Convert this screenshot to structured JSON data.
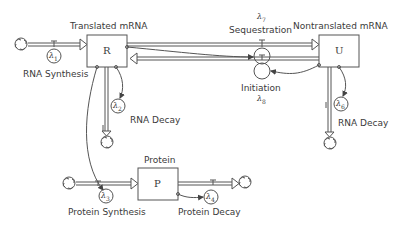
{
  "diagram": {
    "stocks": [
      {
        "id": "R",
        "symbol": "R",
        "title": "Translated mRNA"
      },
      {
        "id": "U",
        "symbol": "U",
        "title": "Nontranslated mRNA"
      },
      {
        "id": "P",
        "symbol": "P",
        "title": "Protein"
      }
    ],
    "flows": [
      {
        "id": "rna_synthesis",
        "label": "RNA Synthesis",
        "rate": "λ",
        "rate_sub": "1"
      },
      {
        "id": "rna_decay_r",
        "label": "RNA Decay",
        "rate": "λ",
        "rate_sub": "2"
      },
      {
        "id": "protein_synthesis",
        "label": "Protein Synthesis",
        "rate": "λ",
        "rate_sub": "3"
      },
      {
        "id": "protein_decay",
        "label": "Protein Decay",
        "rate": "λ",
        "rate_sub": "4"
      },
      {
        "id": "rna_decay_u",
        "label": "RNA Decay",
        "rate": "λ",
        "rate_sub": "6"
      },
      {
        "id": "sequestration",
        "label": "Sequestration",
        "rate": "λ",
        "rate_sub": "7"
      },
      {
        "id": "initiation",
        "label": "Initiation",
        "rate": "λ",
        "rate_sub": "8"
      }
    ],
    "colors": {
      "line": "#555555",
      "text": "#3a3a3a",
      "background": "#ffffff"
    }
  }
}
